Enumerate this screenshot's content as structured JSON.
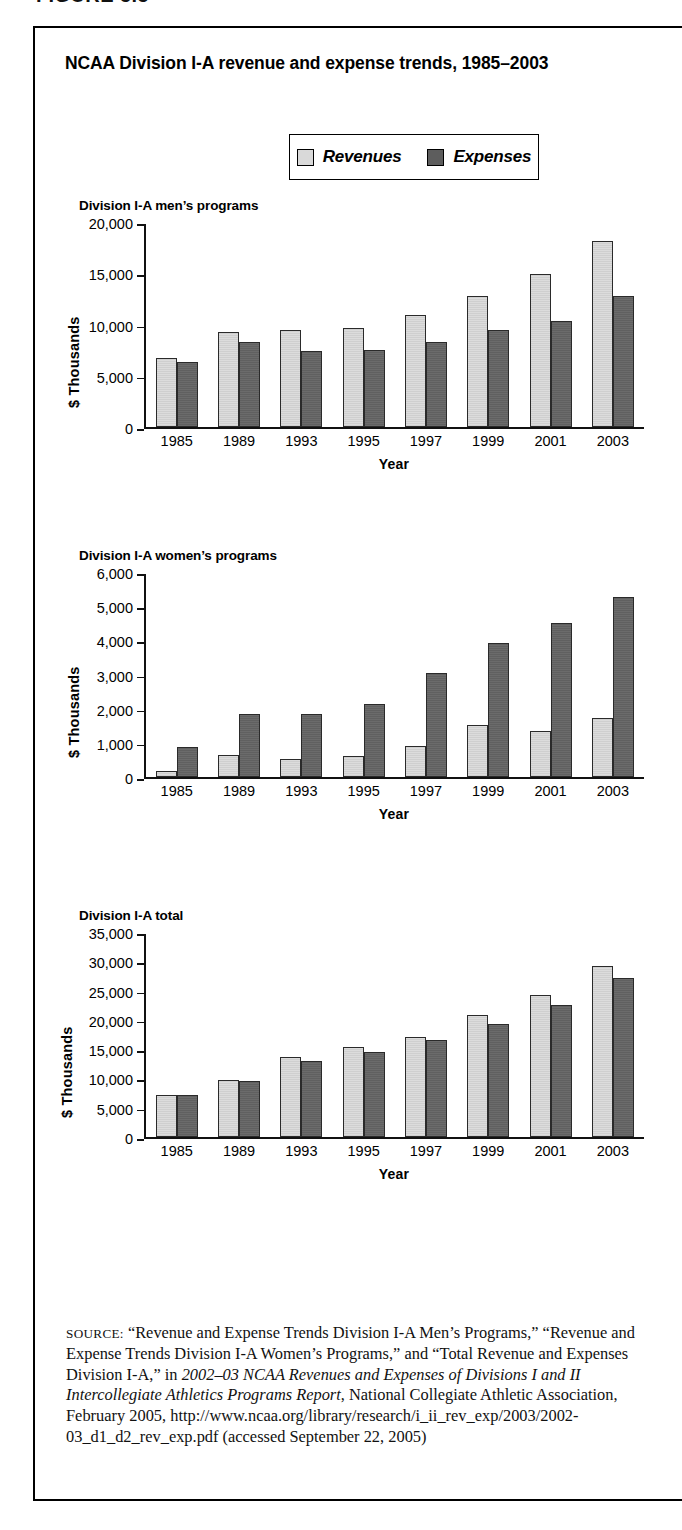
{
  "figure": {
    "label": "FIGURE 5.5"
  },
  "title": "NCAA Division I-A revenue and expense trends, 1985–2003",
  "legend": {
    "revenues_label": "Revenues",
    "expenses_label": "Expenses",
    "revenues_color": "#d9d9d9",
    "expenses_color": "#5d5d5d"
  },
  "axis_title_year": "Year",
  "axis_title_y": "$ Thousands",
  "panels": [
    {
      "title": "Division I-A men’s programs"
    },
    {
      "title": "Division I-A women’s programs"
    },
    {
      "title": "Division I-A total"
    }
  ],
  "source": {
    "prefix": "SOURCE:",
    "text": " “Revenue and Expense Trends Division I-A Men’s Programs,” “Revenue and Expense Trends Division I-A Women’s Programs,” and “Total Revenue and Expenses Division I-A,” in ",
    "italic1": "2002–03 NCAA Revenues and Expenses of Divisions I and II Intercollegiate Athletics Programs Report",
    "text2": ", National Collegiate Athletic Association, February 2005, http://www.ncaa.org/library/research/i_ii_rev_exp/2003/2002-03_d1_d2_rev_exp.pdf (accessed September 22, 2005)"
  },
  "chart_data": [
    {
      "type": "bar",
      "title": "Division I-A men’s programs",
      "xlabel": "Year",
      "ylabel": "$ Thousands",
      "categories": [
        "1985",
        "1989",
        "1993",
        "1995",
        "1997",
        "1999",
        "2001",
        "2003"
      ],
      "series": [
        {
          "name": "Revenues",
          "values": [
            6800,
            9300,
            9500,
            9700,
            11000,
            12800,
            15000,
            18200
          ]
        },
        {
          "name": "Expenses",
          "values": [
            6400,
            8300,
            7500,
            7600,
            8300,
            9500,
            10400,
            12800
          ]
        }
      ],
      "ylim": [
        0,
        20000
      ],
      "yticks": [
        0,
        5000,
        10000,
        15000,
        20000
      ],
      "ytick_labels": [
        "0",
        "5,000",
        "10,000",
        "15,000",
        "20,000"
      ],
      "grid": false,
      "legend_position": "top-center"
    },
    {
      "type": "bar",
      "title": "Division I-A women’s programs",
      "xlabel": "Year",
      "ylabel": "$ Thousands",
      "categories": [
        "1985",
        "1989",
        "1993",
        "1995",
        "1997",
        "1999",
        "2001",
        "2003"
      ],
      "series": [
        {
          "name": "Revenues",
          "values": [
            180,
            650,
            530,
            640,
            910,
            1530,
            1350,
            1740
          ]
        },
        {
          "name": "Expenses",
          "values": [
            880,
            1870,
            1870,
            2140,
            3050,
            3930,
            4530,
            5280
          ]
        }
      ],
      "ylim": [
        0,
        6000
      ],
      "yticks": [
        0,
        1000,
        2000,
        3000,
        4000,
        5000,
        6000
      ],
      "ytick_labels": [
        "0",
        "1,000",
        "2,000",
        "3,000",
        "4,000",
        "5,000",
        "6,000"
      ],
      "grid": false,
      "legend_position": "top-center"
    },
    {
      "type": "bar",
      "title": "Division I-A total",
      "xlabel": "Year",
      "ylabel": "$ Thousands",
      "categories": [
        "1985",
        "1989",
        "1993",
        "1995",
        "1997",
        "1999",
        "2001",
        "2003"
      ],
      "series": [
        {
          "name": "Revenues",
          "values": [
            7200,
            9800,
            13700,
            15500,
            17200,
            20900,
            24300,
            29200
          ]
        },
        {
          "name": "Expenses",
          "values": [
            7200,
            9700,
            13100,
            14500,
            16700,
            19300,
            22600,
            27200
          ]
        }
      ],
      "ylim": [
        0,
        35000
      ],
      "yticks": [
        0,
        5000,
        10000,
        15000,
        20000,
        25000,
        30000,
        35000
      ],
      "ytick_labels": [
        "0",
        "5,000",
        "10,000",
        "15,000",
        "20,000",
        "25,000",
        "30,000",
        "35,000"
      ],
      "grid": false,
      "legend_position": "top-center"
    }
  ]
}
